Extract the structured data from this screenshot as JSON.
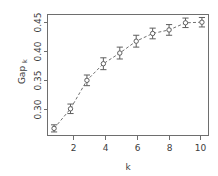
{
  "chart_data": {
    "type": "line",
    "title": "",
    "subtitle": "",
    "xlabel": "k",
    "ylabel": "Gap",
    "ylabel_subscript": "k",
    "ylabel_full": "Gap_k",
    "x": [
      1,
      2,
      3,
      4,
      5,
      6,
      7,
      8,
      9,
      10
    ],
    "values": [
      0.274,
      0.307,
      0.355,
      0.383,
      0.401,
      0.421,
      0.434,
      0.44,
      0.452,
      0.453
    ],
    "error": [
      0.006,
      0.008,
      0.009,
      0.01,
      0.01,
      0.01,
      0.009,
      0.009,
      0.008,
      0.008
    ],
    "series": [
      {
        "name": "Gap_k",
        "values": [
          0.274,
          0.307,
          0.355,
          0.383,
          0.401,
          0.421,
          0.434,
          0.44,
          0.452,
          0.453
        ],
        "error": [
          0.006,
          0.008,
          0.009,
          0.01,
          0.01,
          0.01,
          0.009,
          0.009,
          0.008,
          0.008
        ]
      }
    ],
    "xlim": [
      0.6,
      10.4
    ],
    "ylim": [
      0.262,
      0.466
    ],
    "xticks": [
      2,
      4,
      6,
      8,
      10
    ],
    "xtick_labels": [
      "2",
      "4",
      "6",
      "8",
      "10"
    ],
    "yticks": [
      0.3,
      0.35,
      0.4,
      0.45
    ],
    "ytick_labels": [
      "0.30",
      "0.35",
      "0.40",
      "0.45"
    ],
    "grid": false,
    "legend": null,
    "legend_position": "none",
    "marker": "open-circle",
    "line_style": "dashed",
    "error_bar_style": "capped",
    "ytick_label_rotation": 90,
    "colors": {
      "line": "#707070",
      "marker_edge": "#5e5e5e",
      "marker_fill": "#ffffff",
      "error_bar": "#5e5e5e",
      "axis": "#6e6e6e",
      "text": "#3d3d3d",
      "background": "#ffffff"
    }
  },
  "axes": {
    "x_title": "k",
    "y_title": "Gap",
    "y_title_subscript": "k"
  }
}
